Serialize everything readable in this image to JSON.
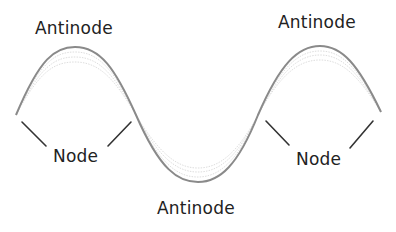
{
  "diagram": {
    "colors": {
      "wave": "#8a8a8a",
      "wave_faint": "#c8c8c8",
      "pointer": "#333333",
      "text": "#222222",
      "background": "#ffffff"
    },
    "labels": [
      {
        "id": "antinode-top-left",
        "text": "Antinode",
        "x": 35,
        "y": 18
      },
      {
        "id": "antinode-top-right",
        "text": "Antinode",
        "x": 278,
        "y": 12
      },
      {
        "id": "node-left",
        "text": "Node",
        "x": 53,
        "y": 146
      },
      {
        "id": "node-right",
        "text": "Node",
        "x": 296,
        "y": 149
      },
      {
        "id": "antinode-bottom",
        "text": "Antinode",
        "x": 157,
        "y": 198
      }
    ],
    "wave": {
      "start": [
        16,
        115
      ],
      "peak_left": [
        75,
        47
      ],
      "trough": [
        198,
        182
      ],
      "peak_right": [
        320,
        46
      ],
      "end": [
        381,
        112
      ]
    },
    "pointer_lines": [
      {
        "from": [
          22,
          122
        ],
        "to": [
          46,
          146
        ]
      },
      {
        "from": [
          108,
          146
        ],
        "to": [
          131,
          122
        ]
      },
      {
        "from": [
          266,
          121
        ],
        "to": [
          289,
          145
        ]
      },
      {
        "from": [
          350,
          148
        ],
        "to": [
          373,
          121
        ]
      }
    ]
  }
}
